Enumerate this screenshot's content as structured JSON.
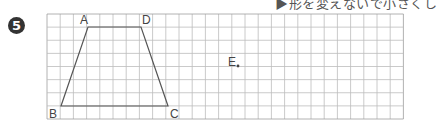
{
  "header": {
    "instruction_fragment": "▶形を変えないで小さくし"
  },
  "problem": {
    "number": "5"
  },
  "grid": {
    "left": 47,
    "top": 14,
    "cell_w": 13.2,
    "cell_h": 13.125,
    "cols": 27,
    "rows": 8,
    "line_color": "#bdbdbd",
    "border_color": "#9e9e9e"
  },
  "figure": {
    "shape": "trapezoid",
    "stroke_color": "#555555",
    "points": [
      {
        "name": "A",
        "x": 88,
        "y": 27,
        "label_x": 80,
        "label_y": 24
      },
      {
        "name": "D",
        "x": 141,
        "y": 27,
        "label_x": 142,
        "label_y": 24
      },
      {
        "name": "C",
        "x": 168,
        "y": 106,
        "label_x": 170,
        "label_y": 118
      },
      {
        "name": "B",
        "x": 61,
        "y": 106,
        "label_x": 49,
        "label_y": 118
      }
    ]
  },
  "point_e": {
    "name": "E",
    "x": 238,
    "y": 66,
    "label_x": 228,
    "label_y": 66
  }
}
